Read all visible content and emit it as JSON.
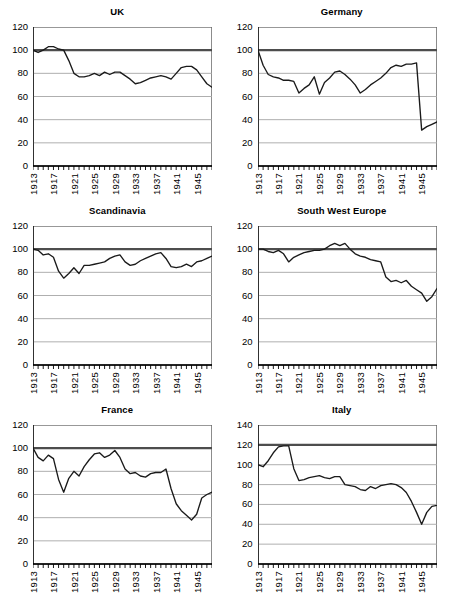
{
  "figure": {
    "layout": "2 columns x 3 rows of line charts",
    "x_tick_labels": [
      "1913",
      "1917",
      "1921",
      "1925",
      "1929",
      "1933",
      "1937",
      "1941",
      "1945"
    ],
    "x_tick_years": [
      1913,
      1917,
      1921,
      1925,
      1929,
      1933,
      1937,
      1941,
      1945
    ],
    "x_range": [
      1913,
      1948
    ],
    "colors": {
      "line": "#1a1a1a",
      "reference_line": "#4d4d4d",
      "gridline": "#a6a6a6",
      "axis": "#000000",
      "background": "#ffffff"
    }
  },
  "chart_data": [
    {
      "type": "line",
      "title": "UK",
      "xlabel": "",
      "ylabel": "",
      "ylim": [
        0,
        120
      ],
      "yticks": [
        0,
        20,
        40,
        60,
        80,
        100,
        120
      ],
      "ytick_labels": [
        "0",
        "20",
        "40",
        "60",
        "80",
        "100",
        "120"
      ],
      "xlim": [
        1913,
        1948
      ],
      "xticks": [
        1913,
        1917,
        1921,
        1925,
        1929,
        1933,
        1937,
        1941,
        1945
      ],
      "xtick_labels": [
        "1913",
        "1917",
        "1921",
        "1925",
        "1929",
        "1933",
        "1937",
        "1941",
        "1945"
      ],
      "grid": true,
      "reference_line": 100,
      "x": [
        1913,
        1914,
        1915,
        1916,
        1917,
        1918,
        1919,
        1920,
        1921,
        1922,
        1923,
        1924,
        1925,
        1926,
        1927,
        1928,
        1929,
        1930,
        1931,
        1932,
        1933,
        1934,
        1935,
        1936,
        1937,
        1938,
        1939,
        1940,
        1941,
        1942,
        1943,
        1944,
        1945,
        1946,
        1947,
        1948
      ],
      "values": [
        100,
        98,
        100,
        103,
        103,
        101,
        100,
        91,
        80,
        77,
        77,
        78,
        80,
        78,
        81,
        79,
        81,
        81,
        78,
        75,
        71,
        72,
        74,
        76,
        77,
        78,
        77,
        75,
        80,
        85,
        86,
        86,
        83,
        77,
        71,
        68
      ]
    },
    {
      "type": "line",
      "title": "Germany",
      "xlabel": "",
      "ylabel": "",
      "ylim": [
        0,
        120
      ],
      "yticks": [
        0,
        20,
        40,
        60,
        80,
        100,
        120
      ],
      "ytick_labels": [
        "0",
        "20",
        "40",
        "60",
        "80",
        "100",
        "120"
      ],
      "xlim": [
        1913,
        1948
      ],
      "xticks": [
        1913,
        1917,
        1921,
        1925,
        1929,
        1933,
        1937,
        1941,
        1945
      ],
      "xtick_labels": [
        "1913",
        "1917",
        "1921",
        "1925",
        "1929",
        "1933",
        "1937",
        "1941",
        "1945"
      ],
      "grid": true,
      "reference_line": 100,
      "x": [
        1913,
        1914,
        1915,
        1916,
        1917,
        1918,
        1919,
        1920,
        1921,
        1922,
        1923,
        1924,
        1925,
        1926,
        1927,
        1928,
        1929,
        1930,
        1931,
        1932,
        1933,
        1934,
        1935,
        1936,
        1937,
        1938,
        1939,
        1940,
        1941,
        1942,
        1943,
        1944,
        1945,
        1946,
        1947,
        1948
      ],
      "values": [
        100,
        87,
        79,
        77,
        76,
        74,
        74,
        73,
        63,
        67,
        70,
        77,
        62,
        72,
        76,
        81,
        82,
        79,
        75,
        70,
        63,
        66,
        70,
        73,
        76,
        80,
        85,
        87,
        86,
        88,
        88,
        89,
        31,
        34,
        36,
        38
      ]
    },
    {
      "type": "line",
      "title": "Scandinavia",
      "xlabel": "",
      "ylabel": "",
      "ylim": [
        0,
        120
      ],
      "yticks": [
        0,
        20,
        40,
        60,
        80,
        100,
        120
      ],
      "ytick_labels": [
        "0",
        "20",
        "40",
        "60",
        "80",
        "100",
        "120"
      ],
      "xlim": [
        1913,
        1948
      ],
      "xticks": [
        1913,
        1917,
        1921,
        1925,
        1929,
        1933,
        1937,
        1941,
        1945
      ],
      "xtick_labels": [
        "1913",
        "1917",
        "1921",
        "1925",
        "1929",
        "1933",
        "1937",
        "1941",
        "1945"
      ],
      "grid": true,
      "reference_line": 100,
      "x": [
        1913,
        1914,
        1915,
        1916,
        1917,
        1918,
        1919,
        1920,
        1921,
        1922,
        1923,
        1924,
        1925,
        1926,
        1927,
        1928,
        1929,
        1930,
        1931,
        1932,
        1933,
        1934,
        1935,
        1936,
        1937,
        1938,
        1939,
        1940,
        1941,
        1942,
        1943,
        1944,
        1945,
        1946,
        1947,
        1948
      ],
      "values": [
        100,
        99,
        95,
        96,
        93,
        81,
        75,
        79,
        84,
        79,
        86,
        86,
        87,
        88,
        89,
        92,
        94,
        95,
        89,
        86,
        87,
        90,
        92,
        94,
        96,
        97,
        92,
        85,
        84,
        85,
        87,
        85,
        89,
        90,
        92,
        94
      ]
    },
    {
      "type": "line",
      "title": "South West Europe",
      "xlabel": "",
      "ylabel": "",
      "ylim": [
        0,
        120
      ],
      "yticks": [
        0,
        20,
        40,
        60,
        80,
        100,
        120
      ],
      "ytick_labels": [
        "0",
        "20",
        "40",
        "60",
        "80",
        "100",
        "120"
      ],
      "xlim": [
        1913,
        1948
      ],
      "xticks": [
        1913,
        1917,
        1921,
        1925,
        1929,
        1933,
        1937,
        1941,
        1945
      ],
      "xtick_labels": [
        "1913",
        "1917",
        "1921",
        "1925",
        "1929",
        "1933",
        "1937",
        "1941",
        "1945"
      ],
      "grid": true,
      "reference_line": 100,
      "x": [
        1913,
        1914,
        1915,
        1916,
        1917,
        1918,
        1919,
        1920,
        1921,
        1922,
        1923,
        1924,
        1925,
        1926,
        1927,
        1928,
        1929,
        1930,
        1931,
        1932,
        1933,
        1934,
        1935,
        1936,
        1937,
        1938,
        1939,
        1940,
        1941,
        1942,
        1943,
        1944,
        1945,
        1946,
        1947,
        1948
      ],
      "values": [
        100,
        100,
        98,
        97,
        99,
        96,
        89,
        93,
        95,
        97,
        98,
        99,
        99,
        100,
        103,
        105,
        103,
        105,
        100,
        96,
        94,
        93,
        91,
        90,
        89,
        76,
        72,
        73,
        71,
        73,
        68,
        65,
        62,
        55,
        59,
        66
      ]
    },
    {
      "type": "line",
      "title": "France",
      "xlabel": "",
      "ylabel": "",
      "ylim": [
        0,
        120
      ],
      "yticks": [
        0,
        20,
        40,
        60,
        80,
        100,
        120
      ],
      "ytick_labels": [
        "0",
        "20",
        "40",
        "60",
        "80",
        "100",
        "120"
      ],
      "xlim": [
        1913,
        1948
      ],
      "xticks": [
        1913,
        1917,
        1921,
        1925,
        1929,
        1933,
        1937,
        1941,
        1945
      ],
      "xtick_labels": [
        "1913",
        "1917",
        "1921",
        "1925",
        "1929",
        "1933",
        "1937",
        "1941",
        "1945"
      ],
      "grid": true,
      "reference_line": 100,
      "x": [
        1913,
        1914,
        1915,
        1916,
        1917,
        1918,
        1919,
        1920,
        1921,
        1922,
        1923,
        1924,
        1925,
        1926,
        1927,
        1928,
        1929,
        1930,
        1931,
        1932,
        1933,
        1934,
        1935,
        1936,
        1937,
        1938,
        1939,
        1940,
        1941,
        1942,
        1943,
        1944,
        1945,
        1946,
        1947,
        1948
      ],
      "values": [
        100,
        92,
        89,
        94,
        91,
        73,
        62,
        74,
        80,
        76,
        84,
        90,
        95,
        96,
        92,
        94,
        98,
        92,
        82,
        78,
        79,
        76,
        75,
        78,
        79,
        79,
        82,
        65,
        52,
        46,
        42,
        38,
        43,
        57,
        60,
        62
      ]
    },
    {
      "type": "line",
      "title": "Italy",
      "xlabel": "",
      "ylabel": "",
      "ylim": [
        0,
        140
      ],
      "yticks": [
        0,
        20,
        40,
        60,
        80,
        100,
        120,
        140
      ],
      "ytick_labels": [
        "0",
        "20",
        "40",
        "60",
        "80",
        "100",
        "120",
        "140"
      ],
      "xlim": [
        1913,
        1948
      ],
      "xticks": [
        1913,
        1917,
        1921,
        1925,
        1929,
        1933,
        1937,
        1941,
        1945
      ],
      "xtick_labels": [
        "1913",
        "1917",
        "1921",
        "1925",
        "1929",
        "1933",
        "1937",
        "1941",
        "1945"
      ],
      "grid": true,
      "reference_line": 120,
      "x": [
        1913,
        1914,
        1915,
        1916,
        1917,
        1918,
        1919,
        1920,
        1921,
        1922,
        1923,
        1924,
        1925,
        1926,
        1927,
        1928,
        1929,
        1930,
        1931,
        1932,
        1933,
        1934,
        1935,
        1936,
        1937,
        1938,
        1939,
        1940,
        1941,
        1942,
        1943,
        1944,
        1945,
        1946,
        1947,
        1948
      ],
      "values": [
        100,
        98,
        104,
        112,
        118,
        119,
        119,
        96,
        84,
        85,
        87,
        88,
        89,
        87,
        86,
        88,
        88,
        80,
        79,
        78,
        75,
        74,
        78,
        76,
        79,
        80,
        81,
        80,
        77,
        72,
        63,
        52,
        40,
        52,
        58,
        59
      ]
    }
  ]
}
